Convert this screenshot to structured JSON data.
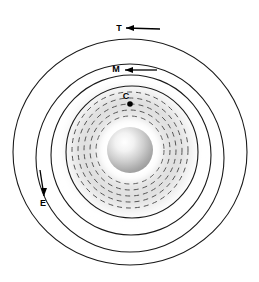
{
  "figure": {
    "background_color": "#ffffff",
    "width": 259,
    "height": 282
  },
  "center_body": {
    "name": "central-sphere",
    "cx": 130,
    "cy": 150,
    "r": 23,
    "highlight_color": "#ffffff",
    "mid_color": "#c9c9c9",
    "edge_color": "#9a9a9a",
    "highlight_offset_x": 0.38,
    "highlight_offset_y": 0.33
  },
  "halo": {
    "name": "diffuse-halo",
    "cx": 130,
    "cy": 150,
    "r": 72,
    "inner_color": "#ffffff",
    "outer_color": "#d8d8d8"
  },
  "dashed_rings": {
    "stroke_color": "#555555",
    "stroke_width": 1.0,
    "dash_pattern": "5 4",
    "cx": 130,
    "cy": 150,
    "radii": [
      34,
      40,
      46,
      52,
      58
    ]
  },
  "solid_rings": {
    "stroke_color": "#1a1a1a",
    "stroke_width": 1.1,
    "items": [
      {
        "id": "ring-inner",
        "cx": 132,
        "cy": 152,
        "rx": 66,
        "ry": 66
      },
      {
        "id": "ring-second",
        "cx": 131,
        "cy": 155,
        "rx": 80,
        "ry": 80
      },
      {
        "id": "ring-third",
        "cx": 130,
        "cy": 158,
        "rx": 94,
        "ry": 94
      },
      {
        "id": "ring-outer",
        "cx": 130,
        "cy": 152,
        "rx": 117,
        "ry": 113
      }
    ]
  },
  "labels": [
    {
      "id": "label-T",
      "text": "T",
      "x": 119,
      "y": 31,
      "ring": "ring-outer",
      "arrow": {
        "direction": "left",
        "tail_x": 160,
        "tail_y": 29,
        "head_x": 126,
        "head_y": 28
      }
    },
    {
      "id": "label-M",
      "text": "M",
      "x": 116,
      "y": 72,
      "ring": "ring-third",
      "arrow": {
        "direction": "left",
        "tail_x": 157,
        "tail_y": 70,
        "head_x": 125,
        "head_y": 70
      }
    },
    {
      "id": "label-C",
      "text": "C",
      "x": 126,
      "y": 99,
      "ring": "dashed-rings",
      "marker_dot": {
        "cx": 130,
        "cy": 104,
        "r": 2.8
      }
    },
    {
      "id": "label-E",
      "text": "E",
      "x": 43,
      "y": 206,
      "ring": "ring-second",
      "arrow": {
        "direction": "down",
        "tail_x": 40,
        "tail_y": 170,
        "head_x": 44,
        "head_y": 196
      }
    }
  ],
  "arrow_style": {
    "color": "#000000",
    "line_width": 1.3,
    "head_length": 8,
    "head_width": 6
  }
}
